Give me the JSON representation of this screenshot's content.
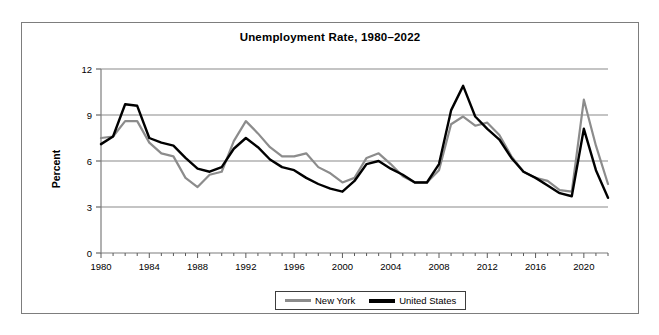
{
  "chart_data": {
    "type": "line",
    "title": "Unemployment Rate, 1980–2022",
    "xlabel": "",
    "ylabel": "Percent",
    "ylim": [
      0,
      12
    ],
    "xlim": [
      1980,
      2022
    ],
    "yticks": [
      "0",
      "3",
      "6",
      "9",
      "12"
    ],
    "ytick_values": [
      0,
      3,
      6,
      9,
      12
    ],
    "xticks": [
      "1980",
      "1984",
      "1988",
      "1992",
      "1996",
      "2000",
      "2004",
      "2008",
      "2012",
      "2016",
      "2020"
    ],
    "xtick_values": [
      1980,
      1984,
      1988,
      1992,
      1996,
      2000,
      2004,
      2008,
      2012,
      2016,
      2020
    ],
    "grid": "horizontal",
    "legend_position": "bottom-center",
    "x": [
      1980,
      1981,
      1982,
      1983,
      1984,
      1985,
      1986,
      1987,
      1988,
      1989,
      1990,
      1991,
      1992,
      1993,
      1994,
      1995,
      1996,
      1997,
      1998,
      1999,
      2000,
      2001,
      2002,
      2003,
      2004,
      2005,
      2006,
      2007,
      2008,
      2009,
      2010,
      2011,
      2012,
      2013,
      2014,
      2015,
      2016,
      2017,
      2018,
      2019,
      2020,
      2021,
      2022
    ],
    "series": [
      {
        "name": "New York",
        "color": "#8c8c8c",
        "values": [
          7.5,
          7.6,
          8.6,
          8.6,
          7.2,
          6.5,
          6.3,
          4.9,
          4.3,
          5.1,
          5.3,
          7.3,
          8.6,
          7.8,
          6.9,
          6.3,
          6.3,
          6.5,
          5.6,
          5.2,
          4.6,
          4.9,
          6.2,
          6.5,
          5.8,
          5.0,
          4.6,
          4.6,
          5.4,
          8.4,
          8.9,
          8.3,
          8.5,
          7.7,
          6.3,
          5.3,
          4.9,
          4.7,
          4.1,
          4.0,
          10.0,
          7.0,
          4.5
        ]
      },
      {
        "name": "United States",
        "color": "#000000",
        "values": [
          7.1,
          7.6,
          9.7,
          9.6,
          7.5,
          7.2,
          7.0,
          6.2,
          5.5,
          5.3,
          5.6,
          6.8,
          7.5,
          6.9,
          6.1,
          5.6,
          5.4,
          4.9,
          4.5,
          4.2,
          4.0,
          4.7,
          5.8,
          6.0,
          5.5,
          5.1,
          4.6,
          4.6,
          5.8,
          9.3,
          10.9,
          8.9,
          8.1,
          7.4,
          6.2,
          5.3,
          4.9,
          4.4,
          3.9,
          3.7,
          8.1,
          5.4,
          3.6
        ]
      }
    ]
  },
  "legend": {
    "items": [
      {
        "label": "New York"
      },
      {
        "label": "United States"
      }
    ]
  }
}
